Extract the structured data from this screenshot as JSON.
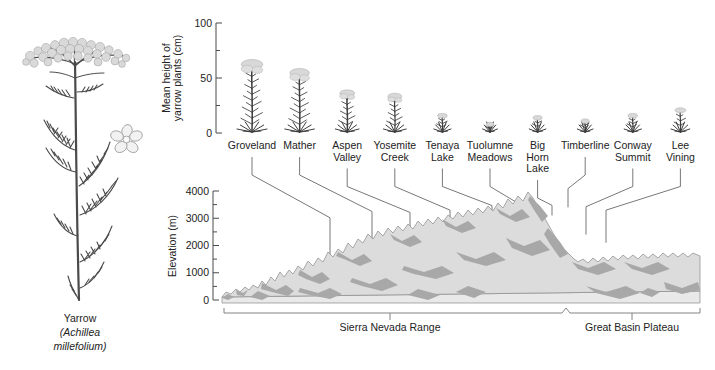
{
  "figure": {
    "specimen_caption_common": "Yarrow",
    "specimen_caption_genus": "(Achillea",
    "specimen_caption_species": "millefolium)"
  },
  "top_chart": {
    "y_axis_title_line1": "Mean height of",
    "y_axis_title_line2": "yarrow plants (cm)",
    "y_ticks": [
      "100",
      "50",
      "0"
    ]
  },
  "bottom_chart": {
    "y_axis_title": "Elevation (m)",
    "y_ticks": [
      "4000",
      "3000",
      "2000",
      "1000",
      "0"
    ],
    "region_left": "Sierra Nevada Range",
    "region_right": "Great Basin Plateau"
  },
  "chart_data": {
    "type": "bar",
    "xlabel": "",
    "ylabel": "Mean height of yarrow plants (cm)",
    "ylim": [
      0,
      100
    ],
    "yticks": [
      0,
      50,
      100
    ],
    "grid": false,
    "legend": "none",
    "categories": [
      "Groveland",
      "Mather",
      "Aspen Valley",
      "Yosemite Creek",
      "Tenaya Lake",
      "Tuolumne Meadows",
      "Big Horn Lake",
      "Timberline",
      "Conway Summit",
      "Lee Vining"
    ],
    "values": [
      65,
      57,
      38,
      35,
      17,
      9,
      15,
      12,
      17,
      22
    ],
    "secondary_chart": {
      "type": "area",
      "title": "Elevation profile",
      "ylabel": "Elevation (m)",
      "ylim": [
        0,
        4000
      ],
      "yticks": [
        0,
        1000,
        2000,
        3000,
        4000
      ],
      "minor_tick_step": 500,
      "xlabel": "",
      "site_elevations_m": [
        850,
        1400,
        1900,
        2100,
        2500,
        2600,
        3100,
        3400,
        2400,
        2100
      ],
      "regions": [
        {
          "name": "Sierra Nevada Range",
          "span": "left"
        },
        {
          "name": "Great Basin Plateau",
          "span": "right"
        }
      ]
    },
    "sites": [
      {
        "label_line1": "Groveland",
        "label_line2": "",
        "label_line3": "",
        "height_cm": 65,
        "elevation_m": 850
      },
      {
        "label_line1": "Mather",
        "label_line2": "",
        "label_line3": "",
        "height_cm": 57,
        "elevation_m": 1400
      },
      {
        "label_line1": "Aspen",
        "label_line2": "Valley",
        "label_line3": "",
        "height_cm": 38,
        "elevation_m": 1900
      },
      {
        "label_line1": "Yosemite",
        "label_line2": "Creek",
        "label_line3": "",
        "height_cm": 35,
        "elevation_m": 2100
      },
      {
        "label_line1": "Tenaya",
        "label_line2": "Lake",
        "label_line3": "",
        "height_cm": 17,
        "elevation_m": 2500
      },
      {
        "label_line1": "Tuolumne",
        "label_line2": "Meadows",
        "label_line3": "",
        "height_cm": 9,
        "elevation_m": 2600
      },
      {
        "label_line1": "Big",
        "label_line2": "Horn",
        "label_line3": "Lake",
        "height_cm": 15,
        "elevation_m": 3100
      },
      {
        "label_line1": "Timberline",
        "label_line2": "",
        "label_line3": "",
        "height_cm": 12,
        "elevation_m": 3400
      },
      {
        "label_line1": "Conway",
        "label_line2": "Summit",
        "label_line3": "",
        "height_cm": 17,
        "elevation_m": 2400
      },
      {
        "label_line1": "Lee",
        "label_line2": "Vining",
        "label_line3": "",
        "height_cm": 22,
        "elevation_m": 2100
      }
    ]
  },
  "colors": {
    "terrain_light": "#dcdcdc",
    "terrain_dark": "#a8a8a8",
    "ink": "#1a1a1a",
    "axis": "#4a4a4a"
  }
}
